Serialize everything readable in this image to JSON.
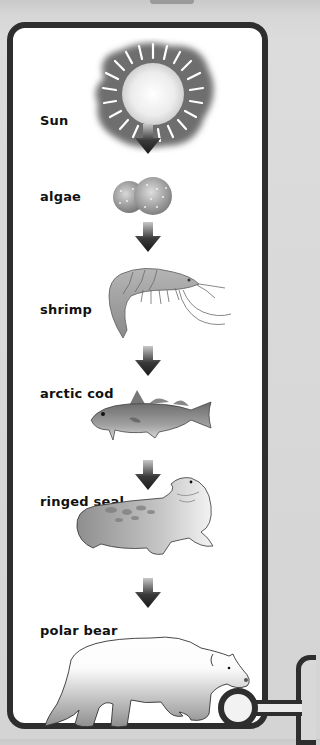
{
  "diagram": {
    "type": "food chain",
    "direction": "top-to-bottom",
    "nodes": [
      {
        "id": "sun",
        "label": "Sun",
        "icon": "sun-icon"
      },
      {
        "id": "algae",
        "label": "algae",
        "icon": "algae-icon"
      },
      {
        "id": "shrimp",
        "label": "shrimp",
        "icon": "shrimp-icon"
      },
      {
        "id": "arctic_cod",
        "label": "arctic cod",
        "icon": "fish-icon"
      },
      {
        "id": "ringed_seal",
        "label": "ringed seal",
        "icon": "seal-icon"
      },
      {
        "id": "polar_bear",
        "label": "polar bear",
        "icon": "polar-bear-icon"
      }
    ],
    "edges": [
      {
        "from": "sun",
        "to": "algae"
      },
      {
        "from": "algae",
        "to": "shrimp"
      },
      {
        "from": "shrimp",
        "to": "arctic_cod"
      },
      {
        "from": "arctic_cod",
        "to": "ringed_seal"
      },
      {
        "from": "ringed_seal",
        "to": "polar_bear"
      }
    ]
  },
  "colors": {
    "frame": "#2e2e2e",
    "panel": "#ffffff",
    "background": "#d6d6d6",
    "arrow": "#1e1e1e"
  }
}
